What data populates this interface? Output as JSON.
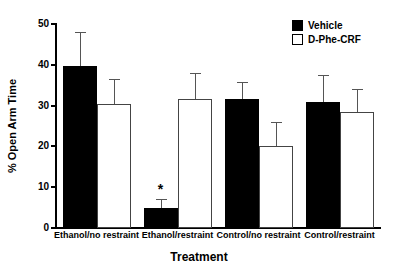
{
  "chart_data": {
    "type": "bar",
    "title": "",
    "xlabel": "Treatment",
    "ylabel": "% Open Arm Time",
    "ylim": [
      0,
      50
    ],
    "yticks": [
      0,
      10,
      20,
      30,
      40,
      50
    ],
    "ytick_labels": [
      "0",
      "10",
      "20",
      "30",
      "40",
      "50"
    ],
    "grid": false,
    "legend_position": "top-right",
    "categories": [
      "Ethanol/no restraint",
      "Ethanol/restraint",
      "Control/no restraint",
      "Control/restraint"
    ],
    "series": [
      {
        "name": "Vehicle",
        "color": "#000000",
        "fill": "solid",
        "values": [
          39.8,
          5.0,
          31.5,
          31.0
        ],
        "errors": [
          8.3,
          2.0,
          4.3,
          6.5
        ]
      },
      {
        "name": "D-Phe-CRF",
        "color": "#ffffff",
        "fill": "open",
        "values": [
          30.4,
          31.5,
          20.0,
          28.5
        ],
        "errors": [
          6.2,
          6.5,
          6.0,
          5.5
        ]
      }
    ],
    "annotations": [
      {
        "text": "*",
        "category": "Ethanol/restraint",
        "series": "Vehicle",
        "meaning": "significant-difference-marker"
      }
    ]
  },
  "legend": {
    "items": [
      {
        "label": "Vehicle",
        "swatch": "filled-square"
      },
      {
        "label": "D-Phe-CRF",
        "swatch": "open-square"
      }
    ]
  },
  "axis": {
    "y_title": "% Open Arm Time",
    "x_title": "Treatment"
  }
}
